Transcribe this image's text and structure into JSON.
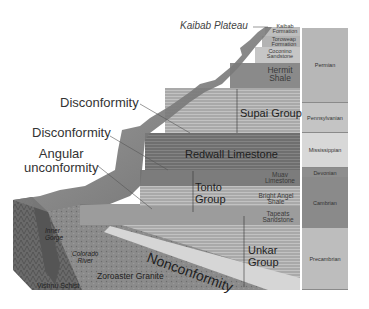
{
  "title_label": "Kaibab Plateau",
  "callouts": {
    "disconformity_upper": "Disconformity",
    "disconformity_lower": "Disconformity",
    "angular_1": "Angular",
    "angular_2": "unconformity",
    "nonconformity": "Nonconformity"
  },
  "strata": {
    "kaibab": "Kaibab",
    "kaibab_formation": "Formation",
    "toroweap": "Toroweap",
    "toroweap_formation": "Formation",
    "coconino": "Coconino",
    "coconino_sandstone": "Sandstone",
    "hermit": "Hermit",
    "hermit_shale": "Shale",
    "supai": "Supai Group",
    "redwall": "Redwall Limestone",
    "muav": "Muav",
    "muav_limestone": "Limestone",
    "tonto_1": "Tonto",
    "tonto_2": "Group",
    "bright_angel": "Bright Angel",
    "bright_angel_shale": "Shale",
    "tapeats": "Tapeats",
    "tapeats_sandstone": "Sandstone",
    "unkar_1": "Unkar",
    "unkar_2": "Group"
  },
  "basement": {
    "inner_gorge_1": "Inner",
    "inner_gorge_2": "Gorge",
    "colorado_1": "Colorado",
    "colorado_2": "River",
    "zoroaster": "Zoroaster Granite",
    "vishnu": "Vishnu Schist"
  },
  "periods": [
    {
      "name": "Permian",
      "color": "#b7b7b7"
    },
    {
      "name": "Pennsylvanian",
      "color": "#c4c4c4"
    },
    {
      "name": "Mississippian",
      "color": "#d8d8d8"
    },
    {
      "name": "Devonian",
      "color": "#8e8e8e"
    },
    {
      "name": "Cambrian",
      "color": "#8a8a8a"
    },
    {
      "name": "Precambrian",
      "color": "#bdbdbd"
    }
  ]
}
